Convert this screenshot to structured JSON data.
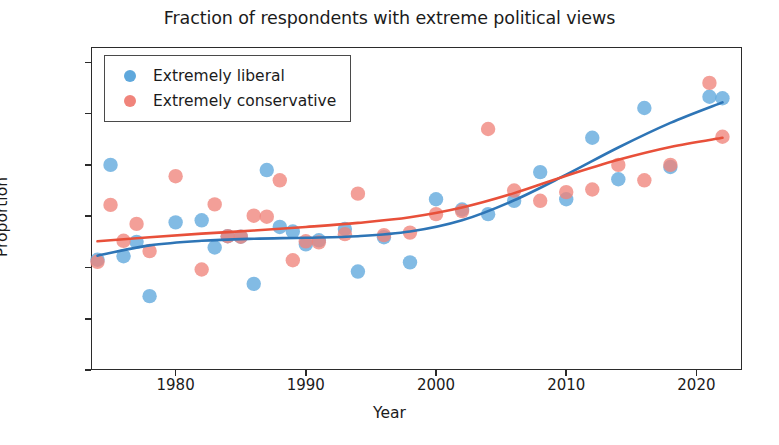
{
  "chart_data": {
    "type": "scatter",
    "title": "Fraction of respondents with extreme political views",
    "xlabel": "Year",
    "ylabel": "Proportion",
    "xlim": [
      1973.5,
      2023.5
    ],
    "ylim": [
      0.0,
      0.063
    ],
    "xticks": [
      1980,
      1990,
      2000,
      2010,
      2020
    ],
    "yticks": [
      0.0,
      0.01,
      0.02,
      0.03,
      0.04,
      0.05,
      0.06
    ],
    "ytick_labels": [
      "0.00",
      "0.01",
      "0.02",
      "0.03",
      "0.04",
      "0.05",
      "0.06"
    ],
    "xtick_labels": [
      "1980",
      "1990",
      "2000",
      "2010",
      "2020"
    ],
    "grid": false,
    "legend_position": "upper left",
    "colors": {
      "liberal": "#5FA8DC",
      "conservative": "#F0847B",
      "liberal_line": "#2E75B6",
      "conservative_line": "#E8503A",
      "axis": "#2b2b2b",
      "text": "#1b1b1b",
      "background": "#ffffff"
    },
    "series": [
      {
        "name": "Extremely liberal",
        "marker": "circle",
        "color": "#5FA8DC",
        "x": [
          1974,
          1975,
          1976,
          1977,
          1978,
          1980,
          1982,
          1983,
          1984,
          1985,
          1986,
          1987,
          1988,
          1989,
          1990,
          1991,
          1993,
          1994,
          1996,
          1998,
          2000,
          2002,
          2004,
          2006,
          2008,
          2010,
          2012,
          2014,
          2016,
          2018,
          2021,
          2022
        ],
        "y": [
          0.0215,
          0.04,
          0.0222,
          0.025,
          0.0144,
          0.0288,
          0.0292,
          0.0239,
          0.0261,
          0.026,
          0.0168,
          0.039,
          0.0279,
          0.027,
          0.0245,
          0.0253,
          0.0275,
          0.0192,
          0.0259,
          0.021,
          0.0333,
          0.0313,
          0.0304,
          0.033,
          0.0386,
          0.0333,
          0.0453,
          0.0372,
          0.0511,
          0.0396,
          0.0533,
          0.053
        ]
      },
      {
        "name": "Extremely conservative",
        "marker": "circle",
        "color": "#F0847B",
        "x": [
          1974,
          1975,
          1976,
          1977,
          1978,
          1980,
          1982,
          1983,
          1984,
          1985,
          1986,
          1987,
          1988,
          1989,
          1990,
          1991,
          1993,
          1994,
          1996,
          1998,
          2000,
          2002,
          2004,
          2006,
          2008,
          2010,
          2012,
          2014,
          2016,
          2018,
          2021,
          2022
        ],
        "y": [
          0.0211,
          0.0322,
          0.0252,
          0.0285,
          0.0232,
          0.0378,
          0.0196,
          0.0323,
          0.0261,
          0.026,
          0.0301,
          0.0299,
          0.037,
          0.0214,
          0.0251,
          0.0249,
          0.0265,
          0.0344,
          0.0263,
          0.0268,
          0.0304,
          0.031,
          0.047,
          0.035,
          0.033,
          0.0347,
          0.0352,
          0.04,
          0.037,
          0.04,
          0.056,
          0.0455
        ]
      }
    ],
    "trend_lines": [
      {
        "name": "Extremely liberal trend",
        "color": "#2E75B6",
        "x": [
          1974,
          1978,
          1982,
          1986,
          1990,
          1994,
          1998,
          2002,
          2006,
          2010,
          2014,
          2018,
          2022
        ],
        "y": [
          0.0223,
          0.0243,
          0.0252,
          0.0256,
          0.0258,
          0.0261,
          0.027,
          0.0292,
          0.0331,
          0.0381,
          0.0434,
          0.0482,
          0.0522
        ]
      },
      {
        "name": "Extremely conservative trend",
        "color": "#E8503A",
        "x": [
          1974,
          1978,
          1982,
          1986,
          1990,
          1994,
          1998,
          2002,
          2006,
          2010,
          2014,
          2018,
          2022
        ],
        "y": [
          0.0251,
          0.0259,
          0.0266,
          0.0272,
          0.0279,
          0.0287,
          0.0298,
          0.0317,
          0.0345,
          0.0379,
          0.041,
          0.0435,
          0.0453
        ]
      }
    ]
  },
  "legend": {
    "items": [
      {
        "label": "Extremely liberal",
        "color": "#5FA8DC"
      },
      {
        "label": "Extremely conservative",
        "color": "#F0847B"
      }
    ]
  }
}
